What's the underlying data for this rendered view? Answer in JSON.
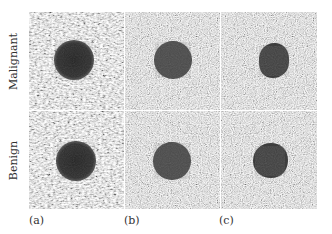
{
  "figure": {
    "rows": [
      {
        "label": "Malignant"
      },
      {
        "label": "Benign"
      }
    ],
    "columns": [
      {
        "label": "(a)",
        "texture": "coarse"
      },
      {
        "label": "(b)",
        "texture": "fine"
      },
      {
        "label": "(c)",
        "texture": "fine"
      }
    ],
    "panels": [
      {
        "row": 0,
        "col": 0,
        "lesion_shape": "round",
        "lesion_tone": "#2a2a2a"
      },
      {
        "row": 0,
        "col": 1,
        "lesion_shape": "round",
        "lesion_tone": "#3a3a3a"
      },
      {
        "row": 0,
        "col": 2,
        "lesion_shape": "irregular",
        "lesion_tone": "#333333"
      },
      {
        "row": 1,
        "col": 0,
        "lesion_shape": "round",
        "lesion_tone": "#2a2a2a"
      },
      {
        "row": 1,
        "col": 1,
        "lesion_shape": "round",
        "lesion_tone": "#3a3a3a"
      },
      {
        "row": 1,
        "col": 2,
        "lesion_shape": "irregular",
        "lesion_tone": "#333333"
      }
    ],
    "colors": {
      "background": "#ffffff",
      "separator": "#ffffff",
      "speckle_mid": "#8a8a8a"
    }
  }
}
